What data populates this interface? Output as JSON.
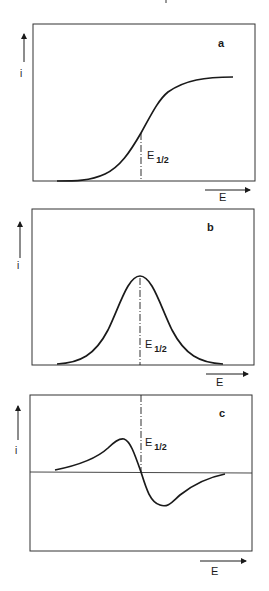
{
  "figure": {
    "top_mark": "",
    "panels": [
      {
        "id": "a",
        "letter": "a",
        "y_axis_label": "i",
        "x_axis_label": "E",
        "marker_label_main": "E",
        "marker_label_sub": "1/2",
        "curve_shape": "sigmoid (polarographic wave)"
      },
      {
        "id": "b",
        "letter": "b",
        "y_axis_label": "i",
        "x_axis_label": "E",
        "marker_label_main": "E",
        "marker_label_sub": "1/2",
        "curve_shape": "bell-shaped peak (first derivative)"
      },
      {
        "id": "c",
        "letter": "c",
        "y_axis_label": "i",
        "x_axis_label": "E",
        "marker_label_main": "E",
        "marker_label_sub": "1/2",
        "curve_shape": "bipolar (second derivative), zero crossing at E1/2"
      }
    ],
    "colors": {
      "ink": "#1a1a1a",
      "frame": "#333333",
      "background": "#ffffff"
    }
  }
}
